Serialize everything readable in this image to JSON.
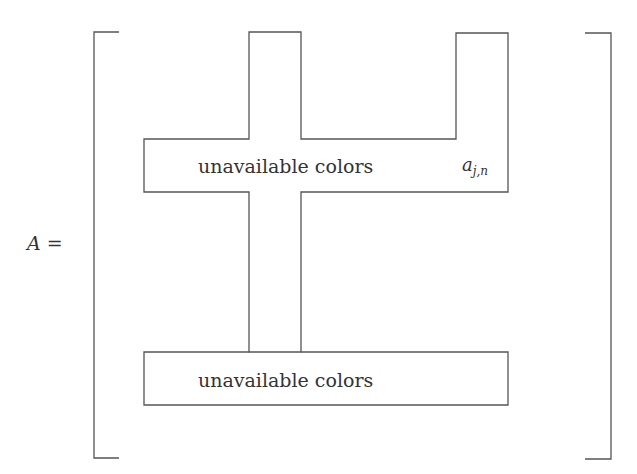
{
  "equation": {
    "lhs_variable": "A",
    "equals_sign": "="
  },
  "matrix": {
    "top_row_label": "unavailable colors",
    "bottom_row_label": "unavailable colors",
    "entry": {
      "base": "a",
      "subscript": "j,n"
    }
  },
  "colors": {
    "stroke": "#555555",
    "text": "#333333",
    "background": "#ffffff"
  }
}
